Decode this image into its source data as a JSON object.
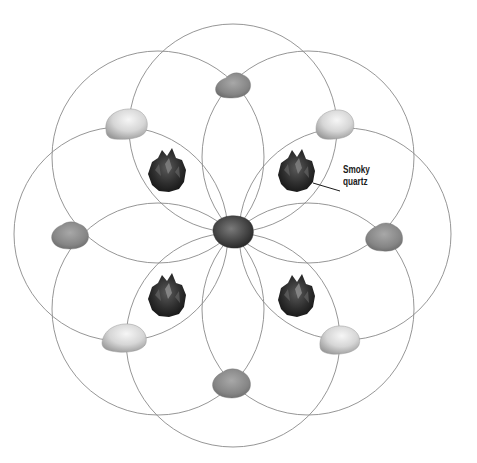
{
  "diagram": {
    "title": "",
    "type": "crystal grid",
    "pattern": "eight overlapping circles (flower-of-life style) around a central stone",
    "colors": {
      "line": "#8a8a8a",
      "background": "#ffffff",
      "center_stone": "#4a4a4a",
      "rough_stone": "#8c8c8c",
      "tumbled_stone": "#d8d8d8",
      "crystal": "#2e2e2e"
    },
    "circles": {
      "count": 8,
      "radius": 106,
      "center": [
        233,
        232
      ]
    },
    "stones": {
      "center": {
        "name": "center-stone",
        "x": 233,
        "y": 232
      },
      "rough": [
        {
          "position": "top",
          "x": 233,
          "y": 87
        },
        {
          "position": "left",
          "x": 70,
          "y": 235
        },
        {
          "position": "right",
          "x": 384,
          "y": 236
        },
        {
          "position": "bottom",
          "x": 233,
          "y": 383
        }
      ],
      "tumbled": [
        {
          "position": "top-left",
          "x": 126,
          "y": 124
        },
        {
          "position": "top-right",
          "x": 335,
          "y": 124
        },
        {
          "position": "bottom-left",
          "x": 124,
          "y": 338
        },
        {
          "position": "bottom-right",
          "x": 340,
          "y": 340
        }
      ],
      "crystals": [
        {
          "position": "top-left",
          "x": 167,
          "y": 172
        },
        {
          "position": "top-right",
          "x": 296,
          "y": 172
        },
        {
          "position": "bottom-left",
          "x": 167,
          "y": 297
        },
        {
          "position": "bottom-right",
          "x": 296,
          "y": 297
        }
      ]
    },
    "annotations": [
      {
        "text_line1": "Smoky",
        "text_line2": "quartz",
        "x": 342,
        "y": 166
      }
    ]
  }
}
